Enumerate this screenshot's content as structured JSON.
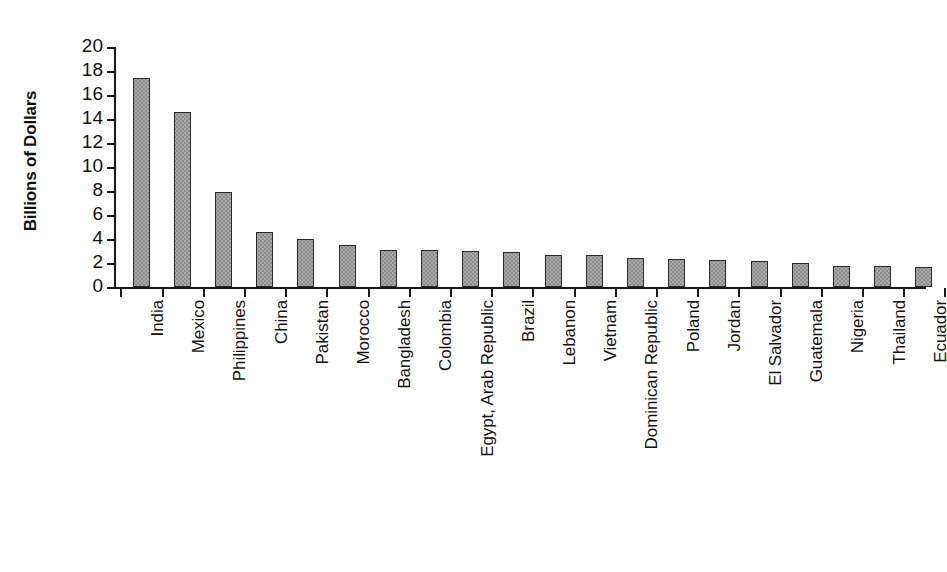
{
  "chart_data": {
    "type": "bar",
    "title": "",
    "subtitle": "",
    "xlabel": "",
    "ylabel": "Billions of Dollars",
    "ylim": [
      0,
      20
    ],
    "yticks": [
      0,
      2,
      4,
      6,
      8,
      10,
      12,
      14,
      16,
      18,
      20
    ],
    "ytick_labels": [
      "0",
      "2",
      "4",
      "6",
      "8",
      "10",
      "12",
      "14",
      "16",
      "18",
      "20"
    ],
    "grid": false,
    "legend": null,
    "bar_color": "#a9a9a9",
    "bar_edge_color": "#2a2a2a",
    "axis_color": "#1a1a1a",
    "categories": [
      "India",
      "Mexico",
      "Philippines",
      "China",
      "Pakistan",
      "Morocco",
      "Bangladesh",
      "Colombia",
      "Egypt, Arab Republic",
      "Brazil",
      "Lebanon",
      "Vietnam",
      "Dominican Republic",
      "Poland",
      "Jordan",
      "El Salvador",
      "Guatemala",
      "Nigeria",
      "Thailand",
      "Ecuador"
    ],
    "values": [
      17.4,
      14.6,
      7.9,
      4.6,
      4.0,
      3.5,
      3.1,
      3.1,
      3.0,
      2.9,
      2.7,
      2.7,
      2.4,
      2.3,
      2.25,
      2.15,
      2.0,
      1.75,
      1.75,
      1.7
    ]
  }
}
